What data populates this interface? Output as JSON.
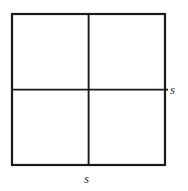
{
  "figure": {
    "shape": "square",
    "stroke_color": "#1a1a1a",
    "background_color": "#ffffff",
    "outer_stroke_width": 2.2,
    "inner_stroke_width": 1.8,
    "geometry": {
      "left": 12,
      "top": 14,
      "right": 165,
      "bottom": 165,
      "width": 153,
      "height": 151,
      "vertical_divider_x": 88.5,
      "horizontal_divider_y": 89.5,
      "horizontal_divider_overshoot_right": 3
    },
    "labels": {
      "right": "s",
      "bottom": "s"
    },
    "label_names": {
      "right": "side-length-label-right",
      "bottom": "side-length-label-bottom"
    },
    "parts": [
      {
        "name": "outer-square",
        "role": "boundary"
      },
      {
        "name": "vertical-divider",
        "role": "divider"
      },
      {
        "name": "horizontal-divider",
        "role": "divider"
      },
      {
        "name": "quadrant-top-left",
        "role": "region"
      },
      {
        "name": "quadrant-top-right",
        "role": "region"
      },
      {
        "name": "quadrant-bottom-left",
        "role": "region"
      },
      {
        "name": "quadrant-bottom-right",
        "role": "region"
      }
    ]
  }
}
